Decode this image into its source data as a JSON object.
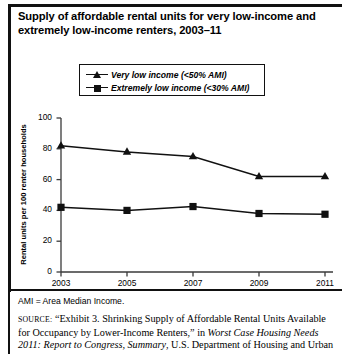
{
  "figure": {
    "title_line1": "Supply of affordable rental units for very low-income and",
    "title_line2": "extremely low-income renters, 2003–11",
    "ami_note": "AMI = Area Median Income.",
    "source_keyword": "SOURCE:",
    "source_text_1": " “Exhibit 3. Shrinking Supply of Affordable Rental Units Available for Occupancy by Lower-Income Renters,” in ",
    "source_italic_1": "Worst Case Housing Needs 2011: Report to Congress, Summary",
    "source_text_2": ", U.S. Department of Housing and Urban"
  },
  "chart_data": {
    "type": "line",
    "title": "Supply of affordable rental units for very low-income and extremely low-income renters, 2003–11",
    "xlabel": "",
    "ylabel": "Rental units per 100 renter households",
    "x": [
      2003,
      2005,
      2007,
      2009,
      2011
    ],
    "xtick_labels": [
      "2003",
      "2005",
      "2007",
      "2009",
      "2011"
    ],
    "ylim": [
      0,
      100
    ],
    "yticks": [
      0,
      20,
      40,
      60,
      80,
      100
    ],
    "ytick_labels": [
      "0",
      "20",
      "40",
      "60",
      "80",
      "100"
    ],
    "grid": false,
    "legend_position": "upper-center",
    "series": [
      {
        "name": "Very low income (<50% AMI)",
        "marker": "triangle",
        "color": "#111111",
        "values": [
          82,
          78,
          75,
          62,
          62
        ]
      },
      {
        "name": "Extremely low income (<30% AMI)",
        "marker": "square",
        "color": "#111111",
        "values": [
          42,
          40,
          42.5,
          38,
          37.5
        ]
      }
    ]
  }
}
